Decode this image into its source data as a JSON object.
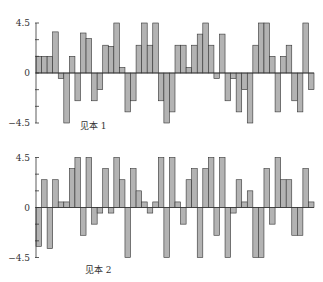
{
  "chart_data": [
    {
      "type": "bar",
      "title": "见本 1",
      "xlabel": "",
      "ylabel": "",
      "ylim": [
        -4.5,
        4.5
      ],
      "yticks": [
        4.5,
        0,
        -4.5
      ],
      "grid": false,
      "legend": null,
      "categories": [
        1,
        2,
        3,
        4,
        5,
        6,
        7,
        8,
        9,
        10,
        11,
        12,
        13,
        14,
        15,
        16,
        17,
        18,
        19,
        20,
        21,
        22,
        23,
        24,
        25,
        26,
        27,
        28,
        29,
        30,
        31,
        32,
        33,
        34,
        35,
        36,
        37,
        38,
        39,
        40,
        41,
        42,
        43,
        44,
        45,
        46,
        47,
        48,
        49,
        50
      ],
      "values": [
        1.5,
        1.5,
        1.5,
        3.7,
        -0.5,
        -4.5,
        1.5,
        -2.5,
        3.6,
        3.1,
        -2.5,
        -1.5,
        2.5,
        2.4,
        4.5,
        0.5,
        -3.5,
        -2.5,
        2.5,
        4.5,
        2.5,
        4.5,
        -2.5,
        -4.5,
        -3.5,
        2.5,
        2.5,
        0.5,
        2.5,
        3.5,
        4.5,
        2.5,
        -0.5,
        3.5,
        -2.5,
        -0.5,
        -3.5,
        -1.5,
        -4.5,
        2.5,
        4.5,
        4.5,
        1.5,
        -3.5,
        1.5,
        2.5,
        -2.5,
        -3.5,
        4.5,
        -1.5
      ]
    },
    {
      "type": "bar",
      "title": "见本 2",
      "xlabel": "",
      "ylabel": "",
      "ylim": [
        -4.5,
        4.5
      ],
      "yticks": [
        4.5,
        0,
        -4.5
      ],
      "grid": false,
      "legend": null,
      "categories": [
        1,
        2,
        3,
        4,
        5,
        6,
        7,
        8,
        9,
        10,
        11,
        12,
        13,
        14,
        15,
        16,
        17,
        18,
        19,
        20,
        21,
        22,
        23,
        24,
        25,
        26,
        27,
        28,
        29,
        30,
        31,
        32,
        33,
        34,
        35,
        36,
        37,
        38,
        39,
        40,
        41,
        42,
        43,
        44,
        45,
        46,
        47,
        48,
        49,
        50
      ],
      "values": [
        -3.5,
        2.5,
        -3.7,
        2.5,
        0.5,
        0.5,
        3.5,
        4.5,
        -2.5,
        4.5,
        -1.5,
        -0.5,
        3.5,
        -0.5,
        4.5,
        2.5,
        -4.5,
        3.5,
        1.5,
        0.5,
        -0.5,
        0.5,
        4.5,
        -4.5,
        4.5,
        0.5,
        -1.5,
        2.5,
        3.5,
        -4.5,
        3.5,
        4.5,
        -2.5,
        4.5,
        -4.5,
        -0.5,
        2.5,
        0.5,
        1.5,
        -4.5,
        -4.5,
        3.5,
        -1.5,
        4.5,
        2.5,
        2.5,
        -2.5,
        -2.5,
        3.5,
        0.5
      ]
    }
  ],
  "charts": [
    {
      "id": "sample-1",
      "label": "见本 1",
      "tick_top": "4.5",
      "tick_zero": "0",
      "tick_bottom": "−4.5"
    },
    {
      "id": "sample-2",
      "label": "见本 2",
      "tick_top": "4.5",
      "tick_zero": "0",
      "tick_bottom": "−4.5"
    }
  ],
  "colors": {
    "bar_fill": "#b3b3b3",
    "bar_stroke": "#333333",
    "axis": "#333333"
  }
}
